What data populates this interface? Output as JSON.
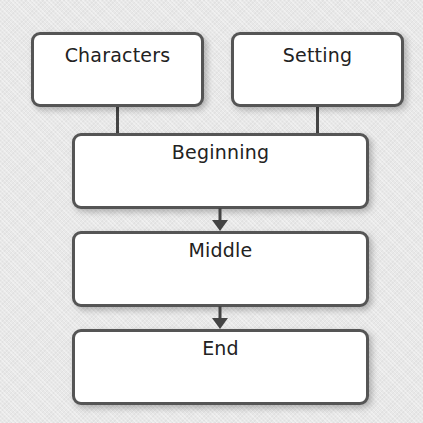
{
  "diagram": {
    "title": "",
    "colors": {
      "border": "#555555",
      "box_fill": "#ffffff",
      "background": "#e8e8e8",
      "connector": "#444444"
    },
    "nodes": [
      {
        "id": "characters",
        "label": "Characters"
      },
      {
        "id": "setting",
        "label": "Setting"
      },
      {
        "id": "beginning",
        "label": "Beginning"
      },
      {
        "id": "middle",
        "label": "Middle"
      },
      {
        "id": "end",
        "label": "End"
      }
    ],
    "edges": [
      {
        "from": "characters",
        "to": "beginning",
        "type": "line"
      },
      {
        "from": "setting",
        "to": "beginning",
        "type": "line"
      },
      {
        "from": "beginning",
        "to": "middle",
        "type": "arrow"
      },
      {
        "from": "middle",
        "to": "end",
        "type": "arrow"
      }
    ]
  }
}
